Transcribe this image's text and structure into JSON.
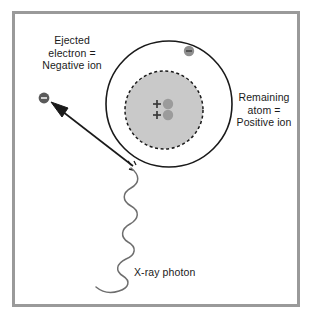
{
  "figure": {
    "frame_color": "#9a9a9a",
    "background_color": "#ffffff"
  },
  "labels": {
    "ejected_electron": "Ejected\nelectron =\nNegative ion",
    "remaining_atom": "Remaining\natom =\nPositive ion",
    "xray_photon": "X-ray photon"
  },
  "diagram": {
    "type": "schematic",
    "elements": {
      "electron_shell": {
        "name": "electron-orbit-circle",
        "shape": "circle",
        "cx": 169,
        "cy": 104,
        "r": 63,
        "stroke": "#1a1a1a",
        "stroke_width": 1.6,
        "fill": "none",
        "dashed": false
      },
      "nucleus_cloud": {
        "name": "nucleus-dashed-circle",
        "shape": "circle",
        "cx": 164,
        "cy": 110,
        "r": 39,
        "stroke": "#1a1a1a",
        "stroke_width": 1.5,
        "fill": "#c9c9c9",
        "dashed": true,
        "dash_pattern": "3 2.6"
      },
      "orbiting_electron": {
        "name": "orbiting-electron",
        "shape": "circle",
        "cx": 189,
        "cy": 51,
        "r": 5.2,
        "fill": "#8f8f8f",
        "charge_symbol": "–"
      },
      "ejected_electron": {
        "name": "ejected-electron",
        "shape": "circle",
        "cx": 44,
        "cy": 98,
        "r": 5.4,
        "fill": "#5a5a5a",
        "charge_symbol": "–"
      },
      "protons": [
        {
          "name": "proton-upper",
          "cx": 157,
          "cy": 104,
          "symbol": "+",
          "color": "#3a3a3a"
        },
        {
          "name": "proton-lower",
          "cx": 157,
          "cy": 115,
          "symbol": "+",
          "color": "#3a3a3a"
        }
      ],
      "neutrons": [
        {
          "name": "neutron-upper",
          "cx": 168,
          "cy": 104,
          "r": 5.2,
          "fill": "#9b9b9b"
        },
        {
          "name": "neutron-lower",
          "cx": 168,
          "cy": 115,
          "r": 5.2,
          "fill": "#9b9b9b"
        }
      ],
      "ejection_arrow": {
        "name": "ejection-arrow",
        "from_x": 133,
        "from_y": 166,
        "to_x": 53,
        "to_y": 104,
        "stroke": "#1a1a1a",
        "stroke_width": 1.6,
        "arrowhead": "filled-triangle"
      },
      "xray_wave": {
        "name": "xray-photon-wave",
        "stroke": "#6e6e6e",
        "stroke_width": 1.5,
        "start_x": 131,
        "start_y": 169,
        "end_x": 96,
        "end_y": 289,
        "amplitude": 9,
        "cycles": 8
      },
      "interaction_point": {
        "name": "interaction-point",
        "cx": 131,
        "cy": 166
      }
    }
  }
}
